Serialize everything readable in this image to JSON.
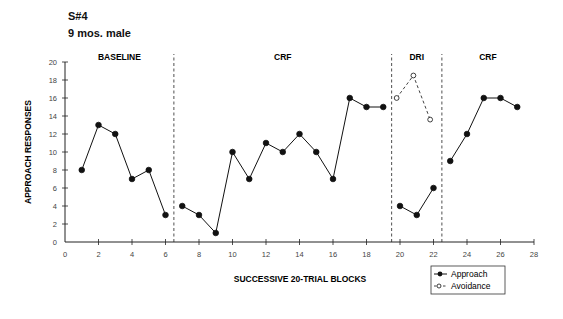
{
  "header": {
    "subject": "S#4",
    "description": "9 mos. male"
  },
  "chart_data": {
    "type": "line",
    "title": "S#4",
    "subtitle": "9 mos. male",
    "xlabel": "SUCCESSIVE 20-TRIAL BLOCKS",
    "ylabel": "APPROACH RESPONSES",
    "xlim": [
      0,
      28
    ],
    "ylim": [
      0,
      20
    ],
    "xticks": [
      0,
      2,
      4,
      6,
      8,
      10,
      12,
      14,
      16,
      18,
      20,
      22,
      24,
      26,
      28
    ],
    "yticks": [
      0,
      2,
      4,
      6,
      8,
      10,
      12,
      14,
      16,
      18,
      20
    ],
    "grid": false,
    "legend_position": "bottom-right",
    "phases": [
      {
        "label": "BASELINE",
        "start": 0,
        "end": 6.5
      },
      {
        "label": "CRF",
        "start": 6.5,
        "end": 19.5
      },
      {
        "label": "DRI",
        "start": 19.5,
        "end": 22.5
      },
      {
        "label": "CRF",
        "start": 22.5,
        "end": 28
      }
    ],
    "phase_lines": [
      6.5,
      19.5,
      22.5
    ],
    "series": [
      {
        "name": "Approach",
        "style": "solid-filled",
        "segments": [
          {
            "x": [
              1,
              2,
              3,
              4,
              5,
              6
            ],
            "y": [
              8,
              13,
              12,
              7,
              8,
              3
            ]
          },
          {
            "x": [
              7,
              8,
              9,
              10,
              11,
              12,
              13,
              14,
              15,
              16,
              17,
              18,
              19
            ],
            "y": [
              4,
              3,
              1,
              10,
              7,
              11,
              10,
              12,
              10,
              7,
              16,
              15,
              15
            ]
          },
          {
            "x": [
              20,
              21,
              22
            ],
            "y": [
              4,
              3,
              6
            ]
          },
          {
            "x": [
              23,
              24,
              25,
              26,
              27
            ],
            "y": [
              9,
              12,
              16,
              16,
              15
            ]
          }
        ]
      },
      {
        "name": "Avoidance",
        "style": "dashed-open",
        "segments": [
          {
            "x": [
              19.8,
              20.8,
              21.8
            ],
            "y": [
              16,
              18.5,
              13.6
            ]
          }
        ]
      }
    ]
  },
  "legend": {
    "approach": "Approach",
    "avoidance": "Avoidance"
  }
}
